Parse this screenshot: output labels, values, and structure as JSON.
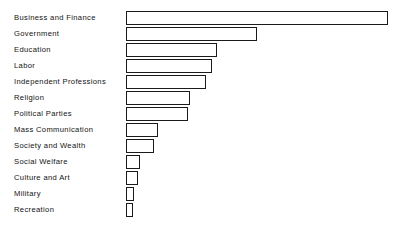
{
  "chart_data": {
    "type": "bar",
    "orientation": "horizontal",
    "title": "",
    "subtitle": "",
    "xlabel": "",
    "ylabel": "",
    "grid": false,
    "legend": null,
    "axis_ticks_visible": false,
    "xlim": [
      0,
      100
    ],
    "categories": [
      "Business and Finance",
      "Government",
      "Education",
      "Labor",
      "Independent Professions",
      "Religion",
      "Political Parties",
      "Mass  Communication",
      "Society and Wealth",
      "Social  Welfare",
      "Culture  and  Art",
      "Military",
      "Recreation"
    ],
    "values": [
      100,
      50,
      34.5,
      32.7,
      30.5,
      24.4,
      23.7,
      12.2,
      10.7,
      5.3,
      4.6,
      3.1,
      2.7
    ],
    "bar_pixel_lengths": [
      262,
      131,
      91,
      86,
      80,
      64,
      62,
      32,
      28,
      14,
      12,
      8,
      7
    ],
    "baseline_x_px": 126,
    "row_height_px": 16,
    "first_row_top_px": 10,
    "colors": {
      "bar_fill": "#ffffff",
      "bar_stroke": "#1a1a1a",
      "background": "#ffffff",
      "label_text": "#121212"
    }
  }
}
